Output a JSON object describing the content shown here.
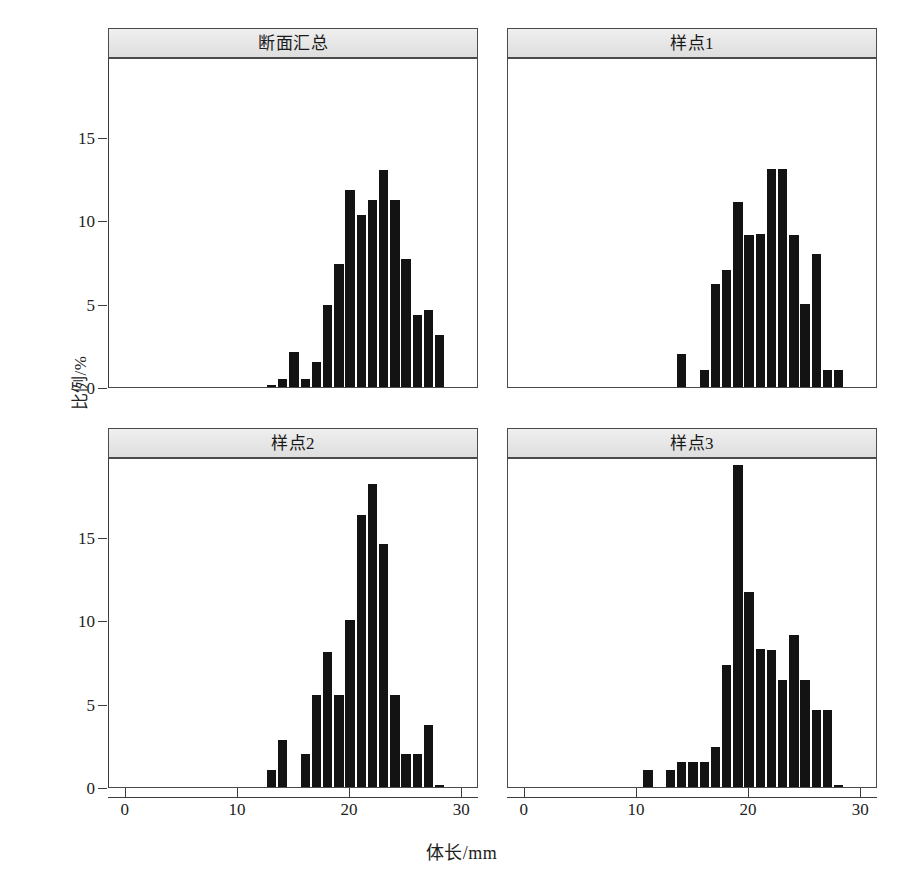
{
  "figure": {
    "xlabel": "体长/mm",
    "ylabel": "比例/%",
    "bar_color": "#131313",
    "strip_bg": "#e6e6e6",
    "strip_border": "#4a4a4a"
  },
  "axes": {
    "x_ticks": [
      0,
      10,
      20,
      30
    ],
    "x_tick_labels": [
      "0",
      "10",
      "20",
      "30"
    ],
    "y_ticks": [
      0,
      5,
      10,
      15
    ],
    "y_tick_labels": [
      "0",
      "5",
      "10",
      "15"
    ],
    "xlim": [
      -1.5,
      31.5
    ],
    "ylim": [
      0,
      19.8
    ]
  },
  "chart_data": {
    "type": "bar",
    "title": "",
    "xlabel": "体长/mm",
    "ylabel": "比例/%",
    "xlim": [
      -1.5,
      31.5
    ],
    "ylim": [
      0,
      19.8
    ],
    "grid": false,
    "legend": "none",
    "bin_width": 1,
    "panels": [
      {
        "label": "断面汇总",
        "x": [
          13,
          14,
          15,
          16,
          17,
          18,
          19,
          20,
          21,
          22,
          23,
          24,
          25,
          26,
          27,
          28
        ],
        "values": [
          0.1,
          0.5,
          2.1,
          0.5,
          1.5,
          4.9,
          7.4,
          11.8,
          10.3,
          11.2,
          13.0,
          11.2,
          7.7,
          4.3,
          4.6,
          3.1
        ]
      },
      {
        "label": "样点1",
        "x": [
          14,
          16,
          17,
          18,
          19,
          20,
          21,
          22,
          23,
          24,
          25,
          26,
          27,
          28
        ],
        "values": [
          2.0,
          1.0,
          6.2,
          7.0,
          11.1,
          9.1,
          9.2,
          13.1,
          13.1,
          9.1,
          5.0,
          8.0,
          1.0,
          1.0
        ]
      },
      {
        "label": "样点2",
        "x": [
          13,
          14,
          16,
          17,
          18,
          19,
          20,
          21,
          22,
          23,
          24,
          25,
          26,
          27,
          28
        ],
        "values": [
          1.0,
          2.8,
          2.0,
          5.5,
          8.1,
          5.5,
          10.0,
          16.3,
          18.2,
          14.6,
          5.5,
          2.0,
          2.0,
          3.7,
          0.0
        ]
      },
      {
        "label": "样点3",
        "x": [
          11,
          13,
          14,
          15,
          16,
          17,
          18,
          19,
          20,
          21,
          22,
          23,
          24,
          25,
          26,
          27,
          28
        ],
        "values": [
          1.0,
          1.0,
          1.5,
          1.5,
          1.5,
          2.4,
          7.3,
          19.3,
          11.7,
          8.3,
          8.2,
          6.4,
          9.1,
          6.4,
          4.6,
          4.6,
          0.0
        ]
      }
    ]
  },
  "panels": [
    {
      "title": "断面汇总"
    },
    {
      "title": "样点1"
    },
    {
      "title": "样点2"
    },
    {
      "title": "样点3"
    }
  ]
}
